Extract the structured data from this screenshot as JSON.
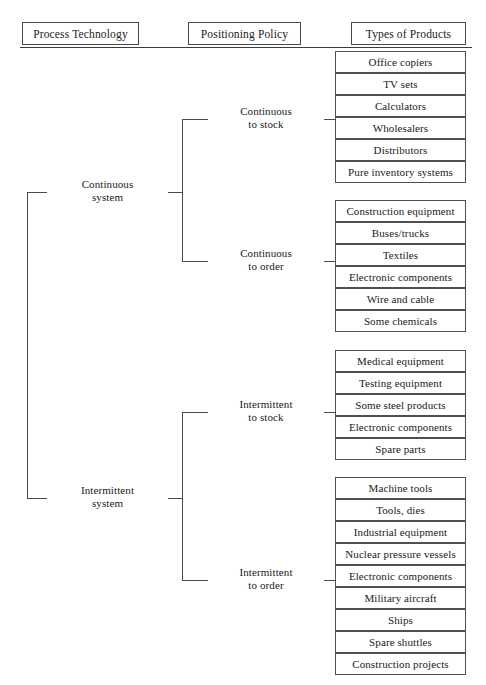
{
  "headers": [
    {
      "label": "Process Technology"
    },
    {
      "label": "Positioning Policy"
    },
    {
      "label": "Types of Products"
    }
  ],
  "process_branches": [
    {
      "line1": "Continuous",
      "line2": "system"
    },
    {
      "line1": "Intermittent",
      "line2": "system"
    }
  ],
  "positioning_branches": [
    {
      "line1": "Continuous",
      "line2": "to stock"
    },
    {
      "line1": "Continuous",
      "line2": "to order"
    },
    {
      "line1": "Intermittent",
      "line2": "to stock"
    },
    {
      "line1": "Intermittent",
      "line2": "to order"
    }
  ],
  "product_groups": [
    {
      "group": "continuous-to-stock",
      "items": [
        "Office copiers",
        "TV sets",
        "Calculators",
        "Wholesalers",
        "Distributors",
        "Pure inventory systems"
      ]
    },
    {
      "group": "continuous-to-order",
      "items": [
        "Construction equipment",
        "Buses/trucks",
        "Textiles",
        "Electronic components",
        "Wire and cable",
        "Some chemicals"
      ]
    },
    {
      "group": "intermittent-to-stock",
      "items": [
        "Medical equipment",
        "Testing equipment",
        "Some steel products",
        "Electronic components",
        "Spare parts"
      ]
    },
    {
      "group": "intermittent-to-order",
      "items": [
        "Machine tools",
        "Tools, dies",
        "Industrial equipment",
        "Nuclear pressure vessels",
        "Electronic components",
        "Military aircraft",
        "Ships",
        "Spare shuttles",
        "Construction projects"
      ]
    }
  ],
  "colors": {
    "line": "#4a4a4a",
    "text": "#1a1a1a",
    "background": "#ffffff"
  }
}
